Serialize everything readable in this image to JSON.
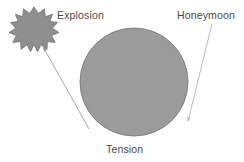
{
  "canvas": {
    "width": 244,
    "height": 162,
    "background_color": "#ffffff"
  },
  "labels": {
    "explosion": "Explosion",
    "honeymoon": "Honeymoon",
    "tension": "Tension"
  },
  "shapes": {
    "circle": {
      "name": "tension-circle",
      "fill_color": "#9b9b9b",
      "stroke_color": "#7d7d7d",
      "center_x": 134,
      "center_y": 82,
      "radius": 54
    },
    "starburst": {
      "name": "explosion-starburst",
      "fill_color": "#8f8f8f",
      "stroke_color": "#6e6e6e",
      "center_x": 34,
      "center_y": 27,
      "outer_radius": 20,
      "inner_radius": 13,
      "points": 15
    }
  },
  "arrows": {
    "left": {
      "name": "explosion-arrow",
      "color": "#9a9a9a",
      "from_x": 89,
      "from_y": 129,
      "to_x": 42,
      "to_y": 46,
      "head_at": "end"
    },
    "right": {
      "name": "honeymoon-arrow",
      "color": "#9a9a9a",
      "from_x": 212,
      "from_y": 24,
      "to_x": 187,
      "to_y": 124,
      "head_at": "end"
    }
  }
}
